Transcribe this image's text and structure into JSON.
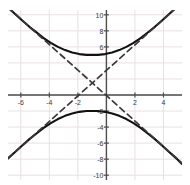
{
  "chart_data": {
    "type": "line",
    "title": "",
    "xlabel": "",
    "ylabel": "",
    "xlim": [
      -6.9,
      5.3
    ],
    "ylim": [
      -10.6,
      10.6
    ],
    "grid": true,
    "grid_spacing": 2,
    "legend": "none",
    "xticks": [
      -6,
      -4,
      -2,
      2,
      4
    ],
    "yticks": [
      10,
      8,
      6,
      -2,
      -4,
      -6,
      -8,
      -10
    ],
    "xtick_labels": [
      "-6",
      "-4",
      "-2",
      "2",
      "4"
    ],
    "ytick_labels": [
      "10",
      "8",
      "6",
      "-2",
      "-4",
      "-6",
      "-8",
      "-10"
    ],
    "center": [
      -1,
      1.5
    ],
    "vertices": [
      [
        -1,
        5
      ],
      [
        -1,
        -2
      ]
    ],
    "a": 3.5,
    "b": 2.2,
    "asymptote_slope": 1.59,
    "series": [
      {
        "name": "hyperbola-upper-branch",
        "style": "solid",
        "color": "#111111",
        "x": [
          -6.9,
          -6.4,
          -5.9,
          -5.4,
          -4.9,
          -4.4,
          -3.9,
          -3.4,
          -2.9,
          -2.4,
          -1.9,
          -1.4,
          -1.0,
          -0.6,
          -0.1,
          0.4,
          0.9,
          1.4,
          1.9,
          2.4,
          2.9,
          3.4,
          3.9,
          4.4,
          4.9,
          5.3
        ],
        "y": [
          10.9,
          10.1,
          9.3,
          8.5,
          7.8,
          7.1,
          6.5,
          6.0,
          5.6,
          5.3,
          5.1,
          5.0,
          5.0,
          5.0,
          5.1,
          5.3,
          5.6,
          6.0,
          6.5,
          7.1,
          7.8,
          8.5,
          9.3,
          10.1,
          10.9,
          11.6
        ]
      },
      {
        "name": "hyperbola-lower-branch",
        "style": "solid",
        "color": "#111111",
        "x": [
          -6.9,
          -6.4,
          -5.9,
          -5.4,
          -4.9,
          -4.4,
          -3.9,
          -3.4,
          -2.9,
          -2.4,
          -1.9,
          -1.4,
          -1.0,
          -0.6,
          -0.1,
          0.4,
          0.9,
          1.4,
          1.9,
          2.4,
          2.9,
          3.4,
          3.9,
          4.4,
          4.9,
          5.3
        ],
        "y": [
          -7.9,
          -7.1,
          -6.3,
          -5.5,
          -4.8,
          -4.1,
          -3.5,
          -3.0,
          -2.6,
          -2.3,
          -2.1,
          -2.0,
          -2.0,
          -2.0,
          -2.1,
          -2.3,
          -2.6,
          -3.0,
          -3.5,
          -4.1,
          -4.8,
          -5.5,
          -6.3,
          -7.1,
          -7.9,
          -8.6
        ]
      },
      {
        "name": "asymptote-positive-slope",
        "style": "dashed",
        "color": "#3a3a3a",
        "x": [
          -6.9,
          5.3
        ],
        "y": [
          -7.9,
          11.5
        ]
      },
      {
        "name": "asymptote-negative-slope",
        "style": "dashed",
        "color": "#3a3a3a",
        "x": [
          -6.9,
          5.3
        ],
        "y": [
          10.9,
          -8.5
        ]
      }
    ],
    "colors": {
      "curve": "#111111",
      "asymptote": "#3a3a3a",
      "axis": "#4d4d4d",
      "grid": "#e9dfe2",
      "background": "#ffffff",
      "tick_text": "#3a3a3a"
    }
  }
}
